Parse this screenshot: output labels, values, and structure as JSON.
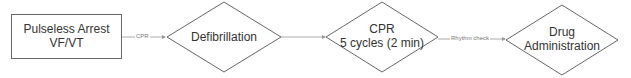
{
  "diagram": {
    "title": "",
    "colors": {
      "stroke": "#555555",
      "edge": "#999999",
      "text": "#333333",
      "edge_text": "#777777"
    },
    "nodes": [
      {
        "id": "start",
        "shape": "rectangle",
        "line1": "Pulseless Arrest",
        "line2": "VF/VT"
      },
      {
        "id": "defib",
        "shape": "diamond",
        "line1": "Defibrillation"
      },
      {
        "id": "cpr",
        "shape": "diamond",
        "line1": "CPR",
        "line2": "5 cycles (2 min)"
      },
      {
        "id": "drug",
        "shape": "diamond",
        "line1": "Drug",
        "line2": "Administration"
      }
    ],
    "edges": [
      {
        "from": "start",
        "to": "defib",
        "label": "CPR"
      },
      {
        "from": "defib",
        "to": "cpr",
        "label": ""
      },
      {
        "from": "cpr",
        "to": "drug",
        "label": "Rhythm check"
      }
    ]
  }
}
